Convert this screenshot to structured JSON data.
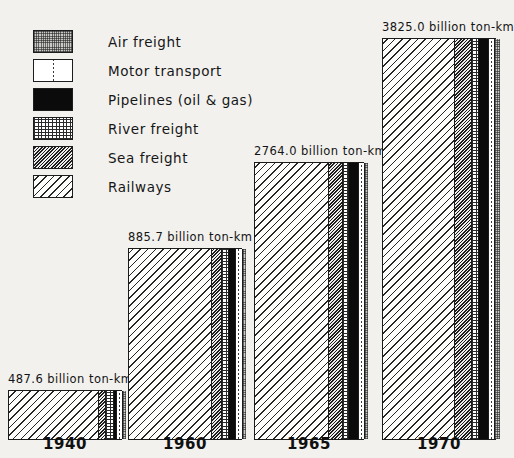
{
  "legend": {
    "items": [
      {
        "key": "air",
        "label": "Air freight",
        "swatch": "stipple-grey-swatch"
      },
      {
        "key": "motor",
        "label": "Motor transport",
        "swatch": "white-dashed-swatch"
      },
      {
        "key": "pipelines",
        "label": "Pipelines (oil & gas)",
        "swatch": "solid-black-swatch"
      },
      {
        "key": "river",
        "label": "River freight",
        "swatch": "brick-rows-swatch"
      },
      {
        "key": "sea",
        "label": "Sea freight",
        "swatch": "dense-diagonal-swatch"
      },
      {
        "key": "railways",
        "label": "Railways",
        "swatch": "wide-diagonal-swatch"
      }
    ]
  },
  "chart_data": {
    "type": "bar",
    "subtype": "stacked-horizontal-segments",
    "title": "",
    "xlabel": "",
    "ylabel": "",
    "unit": "billion ton-km",
    "categories": [
      "1940",
      "1960",
      "1965",
      "1970"
    ],
    "totals": [
      487.6,
      885.7,
      2764.0,
      3825.0
    ],
    "total_labels": [
      "487.6 billion ton-km",
      "885.7 billion ton-km",
      "2764.0 billion ton-km",
      "3825.0 billion ton-km"
    ],
    "series": [
      {
        "name": "Railways",
        "values": [
          415.0,
          763.0,
          1950.0,
          2495.0
        ]
      },
      {
        "name": "Sea freight",
        "values": [
          24.9,
          78.0,
          389.0,
          656.0
        ]
      },
      {
        "name": "River freight",
        "values": [
          36.1,
          51.0,
          126.0,
          174.0
        ]
      },
      {
        "name": "Pipelines (oil & gas)",
        "values": [
          3.8,
          51.2,
          225.0,
          282.0
        ]
      },
      {
        "name": "Motor transport",
        "values": [
          8.9,
          38.5,
          69.0,
          214.0
        ]
      },
      {
        "name": "Air freight",
        "values": [
          0.02,
          1.6,
          1.9,
          1.9
        ]
      }
    ],
    "legend_position": "top-left",
    "grid": false
  },
  "bars": [
    {
      "year": "1940",
      "total_label": "487.6 billion ton-km",
      "pixel": {
        "left": 8,
        "width": 114,
        "height": 50
      },
      "segments": [
        {
          "key": "railways",
          "pct": 79.5
        },
        {
          "key": "sea",
          "pct": 5.0
        },
        {
          "key": "river",
          "pct": 7.0
        },
        {
          "key": "pipelines",
          "pct": 1.5
        },
        {
          "key": "motor",
          "pct": 4.0
        },
        {
          "key": "air",
          "pct": 3.0
        }
      ]
    },
    {
      "year": "1960",
      "total_label": "885.7 billion ton-km",
      "pixel": {
        "left": 128,
        "width": 114,
        "height": 192
      },
      "segments": [
        {
          "key": "railways",
          "pct": 73.0
        },
        {
          "key": "sea",
          "pct": 8.0
        },
        {
          "key": "river",
          "pct": 6.0
        },
        {
          "key": "pipelines",
          "pct": 5.0
        },
        {
          "key": "motor",
          "pct": 5.0
        },
        {
          "key": "air",
          "pct": 3.0
        }
      ]
    },
    {
      "year": "1965",
      "total_label": "2764.0 billion ton-km",
      "pixel": {
        "left": 254,
        "width": 110,
        "height": 278
      },
      "segments": [
        {
          "key": "railways",
          "pct": 68.0
        },
        {
          "key": "sea",
          "pct": 11.5
        },
        {
          "key": "river",
          "pct": 5.0
        },
        {
          "key": "pipelines",
          "pct": 8.0
        },
        {
          "key": "motor",
          "pct": 4.5
        },
        {
          "key": "air",
          "pct": 3.0
        }
      ]
    },
    {
      "year": "1970",
      "total_label": "3825.0 billion ton-km",
      "pixel": {
        "left": 382,
        "width": 114,
        "height": 402
      },
      "segments": [
        {
          "key": "railways",
          "pct": 63.0
        },
        {
          "key": "sea",
          "pct": 15.0
        },
        {
          "key": "river",
          "pct": 5.0
        },
        {
          "key": "pipelines",
          "pct": 8.0
        },
        {
          "key": "motor",
          "pct": 5.0
        },
        {
          "key": "air",
          "pct": 4.0
        }
      ]
    }
  ]
}
